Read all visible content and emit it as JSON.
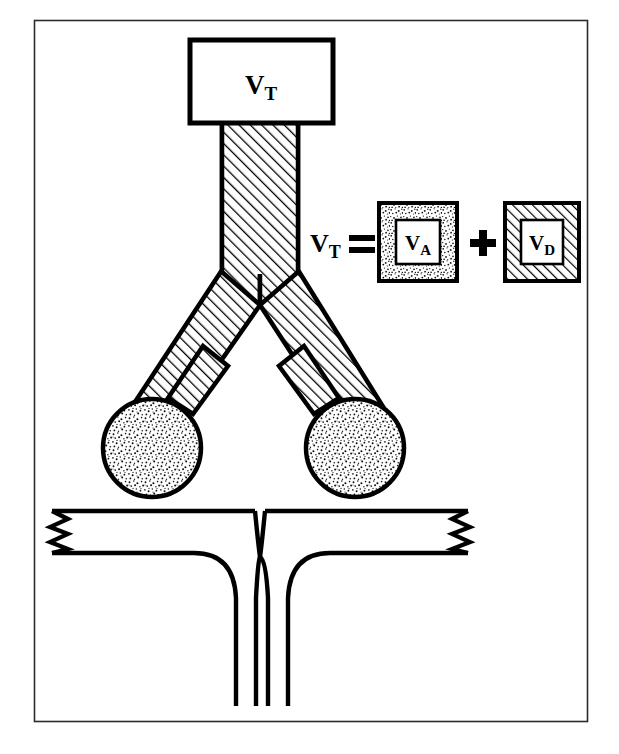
{
  "figure": {
    "name": "tidal-volume-alveolar-deadspace-diagram",
    "frame": {
      "stroke_color": "#1a1a1a",
      "fill_color": "#ffffff",
      "x": 34,
      "y": 20,
      "width": 553,
      "height": 702
    },
    "top_cropped_caption": ""
  },
  "labels": {
    "tidal_volume_box": {
      "main": "V",
      "sub": "T"
    },
    "equation_lhs": {
      "main": "V",
      "sub": "T"
    },
    "equals_sign": "=",
    "plus_sign": "+",
    "alveolar_volume_box": {
      "main": "V",
      "sub": "A"
    },
    "deadspace_volume_box": {
      "main": "V",
      "sub": "D"
    }
  },
  "equation": {
    "text": "VT = VA + VD",
    "lhs_label": "VT",
    "terms": [
      {
        "label": "VA",
        "fill_pattern": "stipple",
        "meaning": "alveolar volume"
      },
      {
        "label": "VD",
        "fill_pattern": "diagonal-hatch",
        "meaning": "dead space volume"
      }
    ]
  },
  "parts": {
    "tidal_volume_box": {
      "label": "VT",
      "x": 188,
      "y": 38,
      "width": 146,
      "height": 86,
      "fill": "#ffffff",
      "stroke": "#000000",
      "stroke_width": 5
    },
    "airway": {
      "name": "trachea-and-bronchi",
      "fill_pattern": "diagonal-hatch",
      "stroke": "#000000",
      "trachea_left": 222,
      "trachea_right": 298,
      "trachea_top": 124,
      "bifurcation_y": 305
    },
    "alveoli": [
      {
        "name": "left-alveolus",
        "cx": 152,
        "cy": 448,
        "r": 49,
        "fill_pattern": "stipple"
      },
      {
        "name": "right-alveolus",
        "cx": 355,
        "cy": 448,
        "r": 49,
        "fill_pattern": "stipple"
      }
    ],
    "capillary": {
      "name": "pulmonary-capillary-vessel",
      "stroke": "#000000",
      "fill": "#ffffff",
      "left_break": "zigzag",
      "right_break": "zigzag",
      "top_y": 511,
      "bottom_y": 553,
      "descend_to_y": 706
    }
  },
  "colors": {
    "ink": "#000000",
    "frame": "#1a1a1a",
    "paper": "#ffffff",
    "hatch": "#000000",
    "stipple": "#000000"
  }
}
